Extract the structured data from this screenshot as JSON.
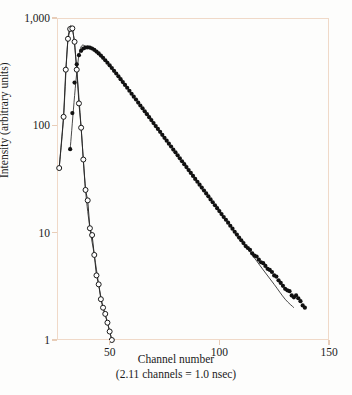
{
  "chart_data": {
    "type": "scatter",
    "title": "",
    "xlabel": "Channel number",
    "xlabel_note": "(2.11 channels = 1.0 nsec)",
    "ylabel": "Intensity (arbitrary units)",
    "yscale": "log",
    "xscale": "linear",
    "xlim": [
      26,
      150
    ],
    "ylim": [
      1,
      1000
    ],
    "xticks": [
      50,
      100,
      150
    ],
    "xtick_labels": [
      "50",
      "100",
      "150"
    ],
    "yticks": [
      1,
      10,
      100,
      1000
    ],
    "ytick_labels": [
      "1",
      "10",
      "100",
      "1,000"
    ],
    "grid": false,
    "legend": "none",
    "series": [
      {
        "name": "instrument-response",
        "marker": "open-circle",
        "color": "#1a1a1a",
        "x": [
          27,
          29,
          30,
          31,
          32,
          33,
          34,
          35,
          36,
          37,
          38,
          39,
          40,
          41,
          42,
          43,
          44,
          45,
          46,
          47,
          48,
          49,
          50,
          51
        ],
        "values": [
          40,
          120,
          330,
          640,
          790,
          800,
          600,
          330,
          160,
          95,
          48,
          25,
          20,
          11,
          9.5,
          6.2,
          4.0,
          3.3,
          2.4,
          2.0,
          1.75,
          1.45,
          1.2,
          1.0
        ]
      },
      {
        "name": "sample-decay",
        "marker": "filled-circle",
        "color": "#111111",
        "x": [
          32,
          33,
          34,
          35,
          36,
          37,
          38,
          39,
          40,
          41,
          42,
          43,
          44,
          45,
          46,
          47,
          48,
          49,
          50,
          51,
          52,
          53,
          54,
          55,
          56,
          57,
          58,
          59,
          60,
          61,
          62,
          63,
          64,
          65,
          66,
          67,
          68,
          69,
          70,
          71,
          72,
          73,
          74,
          75,
          76,
          77,
          78,
          79,
          80,
          81,
          82,
          83,
          84,
          85,
          86,
          87,
          88,
          89,
          90,
          91,
          92,
          93,
          94,
          95,
          96,
          97,
          98,
          99,
          100,
          101,
          102,
          103,
          104,
          105,
          106,
          107,
          108,
          109,
          110,
          111,
          112,
          113,
          114,
          115,
          116,
          117,
          118,
          119,
          120,
          121,
          122,
          123,
          124,
          125,
          126,
          127,
          128,
          129,
          130,
          131,
          132,
          133,
          134,
          135,
          136,
          137,
          138,
          139
        ],
        "values": [
          60,
          130,
          250,
          370,
          450,
          495,
          520,
          530,
          533,
          530,
          520,
          505,
          487,
          468,
          447,
          426,
          404,
          383,
          362,
          342,
          322,
          304,
          286,
          269,
          253,
          238,
          224,
          210,
          197,
          185,
          174,
          163,
          153,
          144,
          135,
          127,
          119,
          112,
          105,
          98.5,
          92.5,
          87,
          81.5,
          76.5,
          72,
          67.5,
          63.5,
          59.5,
          56,
          52.5,
          49.3,
          46.3,
          43.5,
          40.8,
          38.3,
          36,
          33.8,
          31.7,
          29.8,
          28,
          26.3,
          24.7,
          23.2,
          21.8,
          20.4,
          19.2,
          18,
          16.9,
          15.9,
          14.9,
          14,
          13.2,
          12.4,
          11.6,
          10.9,
          10.2,
          9.6,
          9.0,
          8.5,
          8.0,
          7.5,
          7.2,
          6.9,
          6.4,
          6.1,
          6.0,
          5.6,
          5.3,
          5.2,
          4.9,
          4.6,
          4.5,
          4.3,
          4.0,
          3.9,
          3.6,
          3.4,
          3.2,
          3.0,
          2.9,
          2.85,
          2.6,
          2.5,
          2.6,
          2.45,
          2.3,
          2.1,
          2.0
        ]
      }
    ],
    "fit_curves": [
      {
        "name": "instrument-response-fit",
        "x": [
          27,
          29,
          31,
          33,
          35,
          37,
          39,
          41,
          43,
          45,
          47,
          49,
          51
        ],
        "values": [
          40,
          120,
          640,
          800,
          330,
          95,
          25,
          11,
          6.2,
          3.3,
          2.0,
          1.45,
          1.0
        ]
      },
      {
        "name": "sample-decay-fit",
        "x": [
          32,
          36,
          40,
          45,
          50,
          55,
          60,
          65,
          70,
          75,
          80,
          85,
          90,
          95,
          100,
          105,
          110,
          115,
          120,
          125,
          130,
          134
        ],
        "values": [
          60,
          450,
          533,
          468,
          362,
          269,
          197,
          144,
          105,
          76.5,
          56,
          40.8,
          29.8,
          21.8,
          15.9,
          11.6,
          8.5,
          6.2,
          4.5,
          3.3,
          2.4,
          2.0
        ]
      }
    ]
  }
}
